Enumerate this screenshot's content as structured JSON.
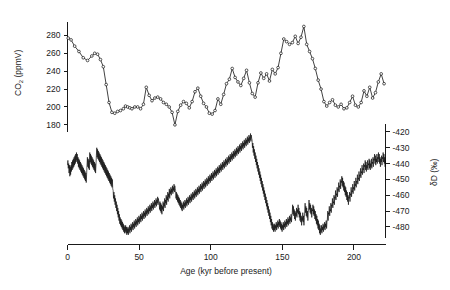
{
  "figure": {
    "title": "",
    "background": "#ffffff",
    "ink_color": "#111111"
  },
  "chart_data": [
    {
      "type": "line",
      "name": "co2-record",
      "title": "",
      "xlabel": "",
      "ylabel": "CO2 (ppmV)",
      "ylabel_display": "CO",
      "ylabel_sub": "2",
      "ylabel_rest": " (ppmV)",
      "xlim": [
        0,
        222
      ],
      "ylim": [
        172,
        295
      ],
      "yticks": [
        180,
        200,
        220,
        240,
        260,
        280
      ],
      "ytick_labels": [
        "180",
        "200",
        "220",
        "240",
        "260",
        "280"
      ],
      "xticks_hidden": true,
      "grid": false,
      "legend": "none",
      "markers": true,
      "x": [
        0.5,
        2.5,
        5,
        8,
        11,
        14,
        17,
        19,
        21,
        23,
        25,
        27,
        29,
        31,
        33,
        35,
        37,
        39,
        40.5,
        42,
        43.5,
        45,
        47,
        49,
        51,
        53,
        55,
        57,
        59,
        61,
        63,
        65,
        67,
        69,
        71,
        73,
        75,
        77,
        79,
        81,
        83,
        85,
        87,
        89,
        91,
        93,
        95,
        97,
        99,
        101,
        103,
        105,
        107,
        109,
        111,
        113,
        115,
        117,
        119,
        121,
        123,
        125,
        127,
        129,
        131,
        133,
        135,
        137,
        139,
        141,
        143,
        145,
        147,
        149,
        151,
        153,
        155,
        157,
        159,
        161,
        163,
        165,
        167,
        169,
        171,
        173,
        175,
        177,
        179,
        181,
        183,
        185,
        187,
        189,
        191,
        193,
        195,
        197,
        199,
        201,
        203,
        205,
        207,
        209,
        211,
        213,
        215,
        217,
        219,
        221
      ],
      "values": [
        277,
        275,
        268,
        262,
        255,
        252,
        257,
        260,
        259,
        253,
        245,
        225,
        205,
        194,
        193,
        195,
        196,
        198,
        201,
        200,
        199,
        198,
        200,
        200,
        198,
        203,
        222,
        213,
        207,
        210,
        211,
        209,
        205,
        203,
        200,
        194,
        180,
        195,
        202,
        206,
        204,
        199,
        206,
        217,
        221,
        212,
        204,
        200,
        193,
        192,
        196,
        209,
        203,
        214,
        226,
        231,
        243,
        233,
        228,
        224,
        232,
        241,
        227,
        215,
        211,
        227,
        238,
        232,
        237,
        229,
        242,
        237,
        244,
        260,
        276,
        273,
        270,
        272,
        279,
        271,
        278,
        290,
        270,
        262,
        254,
        243,
        230,
        220,
        206,
        201,
        205,
        208,
        202,
        200,
        203,
        198,
        199,
        205,
        212,
        202,
        200,
        205,
        218,
        212,
        222,
        210,
        216,
        228,
        237,
        226,
        240,
        252,
        245,
        248
      ]
    },
    {
      "type": "line",
      "name": "deuterium-record",
      "title": "",
      "xlabel": "Age (kyr before present)",
      "ylabel": "dD (per mil)",
      "ylabel_delta": "δ",
      "ylabel_d": "D",
      "ylabel_units": " (‰)",
      "xlim": [
        0,
        222
      ],
      "ylim": [
        -487,
        -415
      ],
      "yticks": [
        -420,
        -430,
        -440,
        -450,
        -460,
        -470,
        -480
      ],
      "ytick_labels": [
        "-420",
        "-430",
        "-440",
        "-450",
        "-460",
        "-470",
        "-480"
      ],
      "xticks": [
        0,
        50,
        100,
        150,
        200
      ],
      "xtick_labels": [
        "0",
        "50",
        "100",
        "150",
        "200"
      ],
      "grid": false,
      "legend": "none",
      "markers": false,
      "y_axis_side": "right",
      "values": [
        -441,
        -438,
        -443,
        -440,
        -446,
        -441,
        -448,
        -442,
        -447,
        -441,
        -445,
        -439,
        -444,
        -438,
        -443,
        -437,
        -442,
        -436,
        -441,
        -435,
        -440,
        -434,
        -439,
        -433,
        -438,
        -434,
        -440,
        -436,
        -442,
        -437,
        -443,
        -438,
        -444,
        -439,
        -445,
        -440,
        -446,
        -441,
        -447,
        -442,
        -448,
        -443,
        -449,
        -444,
        -450,
        -445,
        -451,
        -446,
        -452,
        -447,
        -441,
        -436,
        -442,
        -437,
        -443,
        -438,
        -444,
        -433,
        -439,
        -434,
        -440,
        -435,
        -441,
        -436,
        -442,
        -437,
        -443,
        -438,
        -444,
        -439,
        -445,
        -440,
        -446,
        -441,
        -435,
        -430,
        -436,
        -431,
        -437,
        -432,
        -438,
        -433,
        -439,
        -434,
        -440,
        -435,
        -441,
        -436,
        -442,
        -437,
        -443,
        -438,
        -444,
        -439,
        -445,
        -440,
        -446,
        -441,
        -447,
        -442,
        -448,
        -443,
        -449,
        -444,
        -450,
        -445,
        -451,
        -446,
        -452,
        -447,
        -453,
        -448,
        -454,
        -449,
        -455,
        -450,
        -456,
        -457,
        -462,
        -458,
        -464,
        -460,
        -466,
        -462,
        -468,
        -464,
        -470,
        -466,
        -472,
        -468,
        -474,
        -470,
        -476,
        -472,
        -478,
        -474,
        -479,
        -475,
        -480,
        -476,
        -481,
        -477,
        -482,
        -478,
        -483,
        -479,
        -484,
        -480,
        -483,
        -479,
        -484,
        -480,
        -485,
        -481,
        -484,
        -480,
        -485,
        -481,
        -483,
        -479,
        -484,
        -480,
        -482,
        -478,
        -483,
        -479,
        -481,
        -477,
        -482,
        -478,
        -480,
        -476,
        -481,
        -477,
        -479,
        -475,
        -480,
        -476,
        -478,
        -474,
        -479,
        -475,
        -477,
        -473,
        -478,
        -474,
        -476,
        -472,
        -477,
        -473,
        -475,
        -471,
        -476,
        -472,
        -474,
        -470,
        -475,
        -471,
        -473,
        -469,
        -474,
        -470,
        -472,
        -468,
        -473,
        -469,
        -471,
        -467,
        -472,
        -468,
        -470,
        -466,
        -471,
        -467,
        -469,
        -465,
        -470,
        -466,
        -468,
        -464,
        -469,
        -465,
        -467,
        -463,
        -468,
        -464,
        -466,
        -462,
        -467,
        -463,
        -465,
        -461,
        -466,
        -462,
        -464,
        -465,
        -469,
        -464,
        -470,
        -465,
        -471,
        -466,
        -472,
        -467,
        -469,
        -464,
        -470,
        -465,
        -467,
        -462,
        -468,
        -463,
        -465,
        -460,
        -466,
        -461,
        -463,
        -458,
        -464,
        -459,
        -461,
        -456,
        -462,
        -457,
        -459,
        -455,
        -460,
        -456,
        -458,
        -454,
        -459,
        -455,
        -457,
        -453,
        -458,
        -454,
        -456,
        -457,
        -462,
        -458,
        -463,
        -459,
        -464,
        -460,
        -465,
        -461,
        -466,
        -462,
        -467,
        -463,
        -468,
        -464,
        -469,
        -465,
        -470,
        -466,
        -468,
        -464,
        -469,
        -465,
        -467,
        -463,
        -468,
        -464,
        -466,
        -462,
        -467,
        -463,
        -465,
        -461,
        -466,
        -462,
        -464,
        -460,
        -465,
        -461,
        -463,
        -459,
        -464,
        -460,
        -462,
        -458,
        -463,
        -459,
        -461,
        -457,
        -462,
        -458,
        -460,
        -456,
        -461,
        -457,
        -459,
        -455,
        -460,
        -456,
        -458,
        -454,
        -459,
        -455,
        -457,
        -453,
        -458,
        -454,
        -456,
        -452,
        -457,
        -453,
        -455,
        -451,
        -456,
        -452,
        -454,
        -450,
        -455,
        -451,
        -453,
        -449,
        -454,
        -450,
        -452,
        -448,
        -453,
        -449,
        -451,
        -447,
        -452,
        -448,
        -450,
        -446,
        -451,
        -447,
        -449,
        -445,
        -450,
        -446,
        -448,
        -444,
        -449,
        -445,
        -447,
        -443,
        -448,
        -444,
        -446,
        -442,
        -447,
        -443,
        -445,
        -441,
        -446,
        -442,
        -444,
        -440,
        -445,
        -441,
        -443,
        -439,
        -444,
        -440,
        -442,
        -438,
        -443,
        -439,
        -441,
        -437,
        -442,
        -438,
        -440,
        -436,
        -441,
        -437,
        -439,
        -435,
        -440,
        -436,
        -438,
        -434,
        -439,
        -435,
        -437,
        -433,
        -438,
        -434,
        -436,
        -432,
        -437,
        -433,
        -435,
        -431,
        -436,
        -432,
        -434,
        -430,
        -435,
        -431,
        -433,
        -429,
        -434,
        -430,
        -432,
        -428,
        -433,
        -429,
        -431,
        -427,
        -432,
        -428,
        -430,
        -426,
        -431,
        -427,
        -429,
        -425,
        -430,
        -426,
        -428,
        -424,
        -429,
        -425,
        -427,
        -423,
        -428,
        -424,
        -426,
        -422,
        -427,
        -423,
        -425,
        -421,
        -426,
        -422,
        -424,
        -425,
        -430,
        -427,
        -433,
        -429,
        -435,
        -431,
        -437,
        -433,
        -439,
        -435,
        -441,
        -437,
        -443,
        -439,
        -445,
        -441,
        -447,
        -443,
        -449,
        -445,
        -451,
        -447,
        -453,
        -449,
        -455,
        -451,
        -457,
        -453,
        -459,
        -455,
        -461,
        -457,
        -463,
        -459,
        -465,
        -461,
        -467,
        -463,
        -469,
        -465,
        -471,
        -467,
        -473,
        -469,
        -475,
        -471,
        -477,
        -473,
        -479,
        -475,
        -481,
        -477,
        -482,
        -478,
        -483,
        -479,
        -482,
        -478,
        -483,
        -479,
        -481,
        -477,
        -482,
        -478,
        -480,
        -476,
        -481,
        -477,
        -479,
        -475,
        -480,
        -476,
        -481,
        -477,
        -482,
        -478,
        -483,
        -479,
        -481,
        -477,
        -482,
        -478,
        -480,
        -476,
        -481,
        -477,
        -479,
        -475,
        -480,
        -476,
        -478,
        -474,
        -479,
        -475,
        -477,
        -473,
        -478,
        -474,
        -476,
        -472,
        -477,
        -473,
        -471,
        -466,
        -472,
        -467,
        -473,
        -469,
        -475,
        -470,
        -476,
        -471,
        -473,
        -468,
        -474,
        -469,
        -471,
        -466,
        -472,
        -468,
        -474,
        -470,
        -476,
        -471,
        -477,
        -473,
        -479,
        -474,
        -476,
        -471,
        -477,
        -473,
        -479,
        -474,
        -470,
        -465,
        -471,
        -467,
        -473,
        -468,
        -474,
        -470,
        -476,
        -471,
        -468,
        -463,
        -469,
        -465,
        -471,
        -466,
        -472,
        -468,
        -474,
        -469,
        -470,
        -466,
        -472,
        -467,
        -473,
        -469,
        -475,
        -470,
        -476,
        -472,
        -478,
        -473,
        -479,
        -475,
        -481,
        -476,
        -482,
        -478,
        -484,
        -479,
        -485,
        -481,
        -483,
        -479,
        -484,
        -480,
        -482,
        -478,
        -483,
        -479,
        -481,
        -477,
        -482,
        -478,
        -480,
        -476,
        -481,
        -477,
        -475,
        -470,
        -476,
        -471,
        -472,
        -467,
        -473,
        -469,
        -470,
        -465,
        -471,
        -466,
        -467,
        -462,
        -468,
        -464,
        -465,
        -460,
        -466,
        -461,
        -462,
        -457,
        -463,
        -459,
        -460,
        -455,
        -461,
        -456,
        -457,
        -452,
        -458,
        -454,
        -455,
        -450,
        -456,
        -451,
        -452,
        -448,
        -454,
        -449,
        -455,
        -451,
        -457,
        -452,
        -458,
        -454,
        -460,
        -455,
        -461,
        -457,
        -463,
        -458,
        -464,
        -460,
        -466,
        -461,
        -462,
        -458,
        -464,
        -459,
        -460,
        -455,
        -461,
        -457,
        -458,
        -453,
        -459,
        -455,
        -456,
        -451,
        -457,
        -453,
        -454,
        -449,
        -455,
        -451,
        -452,
        -447,
        -453,
        -449,
        -450,
        -445,
        -451,
        -447,
        -448,
        -443,
        -449,
        -445,
        -446,
        -441,
        -447,
        -443,
        -444,
        -440,
        -446,
        -441,
        -442,
        -438,
        -444,
        -439,
        -445,
        -441,
        -443,
        -438,
        -444,
        -440,
        -441,
        -437,
        -443,
        -438,
        -444,
        -440,
        -442,
        -437,
        -443,
        -439,
        -440,
        -436,
        -442,
        -437,
        -438,
        -434,
        -440,
        -435,
        -441,
        -437,
        -439,
        -434,
        -440,
        -436,
        -437,
        -433,
        -439,
        -434,
        -440,
        -436,
        -442,
        -437,
        -439,
        -435,
        -441,
        -436,
        -437,
        -433,
        -439,
        -434,
        -440,
        -436,
        -442,
        -438
      ]
    }
  ],
  "axes": {
    "xaxis_label": "Age (kyr before present)",
    "co2_axis_label_main": "CO",
    "co2_axis_label_sub": "2",
    "co2_axis_label_units": " (ppmV)",
    "dd_axis_label_delta": "δD",
    "dd_axis_label_units": " (‰)"
  }
}
